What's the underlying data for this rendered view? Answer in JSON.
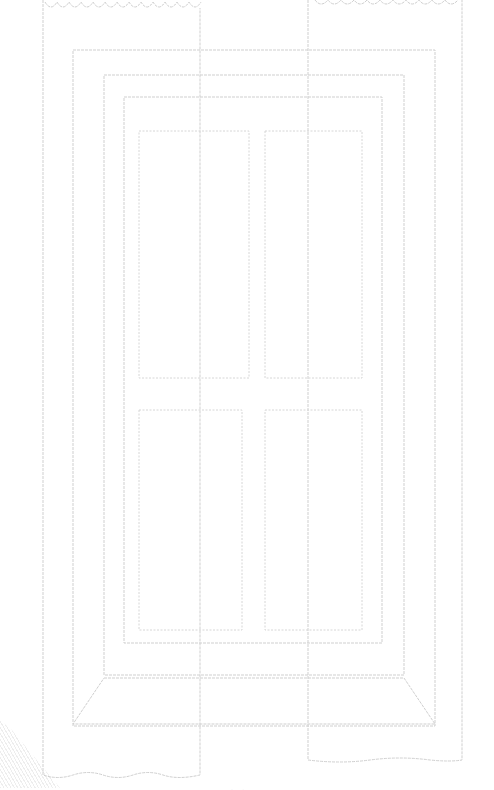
{
  "drawing": {
    "subject": "window with curtains and four-pane door outline",
    "line_color": "#cfcfcf",
    "background": "#ffffff"
  },
  "caption": {
    "text": "· ·"
  }
}
